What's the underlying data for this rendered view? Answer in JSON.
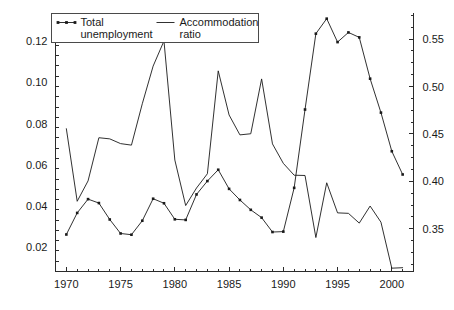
{
  "chart_data": {
    "type": "line",
    "title": "",
    "subtitle": "",
    "xlabel": "",
    "ylabel": "",
    "y2label": "",
    "grid": false,
    "legend_position": "top-left",
    "x": [
      1970,
      1971,
      1972,
      1973,
      1974,
      1975,
      1976,
      1977,
      1978,
      1979,
      1980,
      1981,
      1982,
      1983,
      1984,
      1985,
      1986,
      1987,
      1988,
      1989,
      1990,
      1991,
      1992,
      1993,
      1994,
      1995,
      1996,
      1997,
      1998,
      1999,
      2000,
      2001
    ],
    "xlim": [
      1969,
      2002
    ],
    "xticks": [
      1970,
      1975,
      1980,
      1985,
      1990,
      1995,
      2000
    ],
    "xticklabels": [
      "1970",
      "1975",
      "1980",
      "1985",
      "1990",
      "1995",
      "2000"
    ],
    "xminor_step": 1,
    "ylim": [
      0.008,
      0.134
    ],
    "yticks": [
      0.02,
      0.04,
      0.06,
      0.08,
      0.1,
      0.12
    ],
    "yticklabels": [
      "0.02",
      "0.04",
      "0.06",
      "0.08",
      "0.10",
      "0.12"
    ],
    "yminor_step": 0.005,
    "y2lim": [
      0.305,
      0.578
    ],
    "y2ticks": [
      0.35,
      0.4,
      0.45,
      0.5,
      0.55
    ],
    "y2ticklabels": [
      "0.35",
      "0.40",
      "0.45",
      "0.50",
      "0.55"
    ],
    "y2minor_step": 0.0125,
    "series": [
      {
        "name": "Total unemployment",
        "legend_label_line1": "Total",
        "legend_label_line2": "unemployment",
        "axis": "left",
        "marker": "square",
        "color": "#1a1a1a",
        "values": [
          0.026,
          0.0365,
          0.0432,
          0.0413,
          0.0333,
          0.0265,
          0.0259,
          0.0327,
          0.0434,
          0.0412,
          0.0334,
          0.0331,
          0.0455,
          0.052,
          0.0575,
          0.0482,
          0.0428,
          0.038,
          0.0342,
          0.0272,
          0.0274,
          0.0487,
          0.0868,
          0.1237,
          0.131,
          0.1196,
          0.1243,
          0.1219,
          0.1018,
          0.0853,
          0.0665,
          0.0552
        ]
      },
      {
        "name": "Accommodation ratio",
        "legend_label_line1": "Accommodation",
        "legend_label_line2": "ratio",
        "axis": "right",
        "marker": "none",
        "color": "#1a1a1a",
        "values": [
          0.4555,
          0.379,
          0.4005,
          0.446,
          0.4448,
          0.4398,
          0.4382,
          0.4818,
          0.5215,
          0.548,
          0.4225,
          0.3745,
          0.393,
          0.408,
          0.5165,
          0.47,
          0.449,
          0.4502,
          0.508,
          0.4395,
          0.419,
          0.4065,
          0.4062,
          0.3408,
          0.3985,
          0.3668,
          0.3663,
          0.356,
          0.374,
          0.357,
          0.3085,
          0.309
        ]
      }
    ]
  },
  "legend": {
    "entries": [
      {
        "sample": "line-with-markers",
        "line1": "Total",
        "line2": "unemployment"
      },
      {
        "sample": "plain-line",
        "line1": "Accommodation",
        "line2": "ratio"
      }
    ]
  }
}
